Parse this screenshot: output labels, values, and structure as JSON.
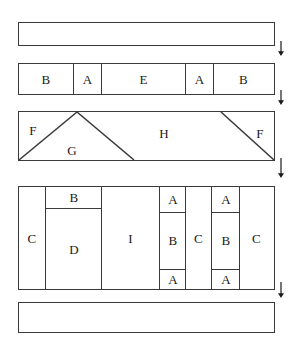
{
  "diagram": {
    "stroke_color": "#3a3a3a",
    "background_color": "#ffffff",
    "label_color": "#1a1a1a",
    "rows": [
      {
        "name": "row-1-whole",
        "label": "",
        "cells": []
      },
      {
        "name": "row-2-five-part",
        "cells": [
          {
            "label": "B"
          },
          {
            "label": "A"
          },
          {
            "label": "E"
          },
          {
            "label": "A"
          },
          {
            "label": "B"
          }
        ]
      },
      {
        "name": "row-3-triangles",
        "cells": [
          {
            "label": "F"
          },
          {
            "label": "G"
          },
          {
            "label": "H"
          },
          {
            "label": "F"
          }
        ]
      },
      {
        "name": "row-4-subdivided",
        "cells": [
          {
            "label": "C"
          },
          {
            "label": "B"
          },
          {
            "label": "D"
          },
          {
            "label": "I"
          },
          {
            "label": "A"
          },
          {
            "label": "B"
          },
          {
            "label": "A"
          },
          {
            "label": "C"
          },
          {
            "label": "A"
          },
          {
            "label": "B"
          },
          {
            "label": "A"
          },
          {
            "label": "C"
          }
        ]
      },
      {
        "name": "row-5-whole",
        "label": "",
        "cells": []
      }
    ],
    "arrows": {
      "count": 4,
      "direction": "down",
      "glyph": "downward-arrow"
    }
  }
}
